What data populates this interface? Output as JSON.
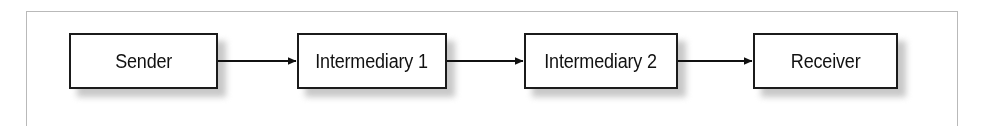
{
  "figure": {
    "type": "flow-diagram",
    "orientation": "left-to-right",
    "frame": {
      "visible": true,
      "color": "#b9b9b9"
    },
    "background_color": "#ffffff",
    "box_border_color": "#1b1b1b",
    "box_fill_color": "#ffffff",
    "shadow_color": "#9a9a9a",
    "arrow_color": "#111111",
    "nodes": [
      {
        "id": "sender",
        "label": "Sender",
        "x": 69,
        "y": 33,
        "width": 149,
        "height": 56
      },
      {
        "id": "intermediary-1",
        "label": "Intermediary 1",
        "x": 297,
        "y": 33,
        "width": 150,
        "height": 56
      },
      {
        "id": "intermediary-2",
        "label": "Intermediary 2",
        "x": 524,
        "y": 33,
        "width": 154,
        "height": 56
      },
      {
        "id": "receiver",
        "label": "Receiver",
        "x": 753,
        "y": 33,
        "width": 145,
        "height": 56
      }
    ],
    "arrows": [
      {
        "id": "arrow-sender-to-intermediary-1",
        "from": "sender",
        "to": "intermediary-1",
        "x1": 218,
        "x2": 297,
        "y": 61,
        "label": ""
      },
      {
        "id": "arrow-intermediary-1-to-intermediary-2",
        "from": "intermediary-1",
        "to": "intermediary-2",
        "x1": 447,
        "x2": 524,
        "y": 61,
        "label": ""
      },
      {
        "id": "arrow-intermediary-2-to-receiver",
        "from": "intermediary-2",
        "to": "receiver",
        "x1": 678,
        "x2": 753,
        "y": 61,
        "label": ""
      }
    ]
  }
}
